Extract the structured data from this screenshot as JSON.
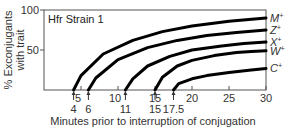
{
  "chart_data": {
    "type": "line",
    "title": "Hfr Strain 1",
    "xlabel": "Minutes prior to interruption of conjugation",
    "ylabel": "% Exconjugants with trait",
    "xlim": [
      0,
      30
    ],
    "ylim": [
      0,
      100
    ],
    "x_ticks": [
      5,
      10,
      15,
      20,
      25,
      30
    ],
    "y_ticks": [
      50,
      100
    ],
    "grid": false,
    "legend_position": "right-end labels",
    "entry_times": [
      {
        "label": "4",
        "value": 4
      },
      {
        "label": "6",
        "value": 6
      },
      {
        "label": "11",
        "value": 11
      },
      {
        "label": "15",
        "value": 15
      },
      {
        "label": "17.5",
        "value": 17.5
      }
    ],
    "series": [
      {
        "name": "M+",
        "entry_time": 4,
        "x": [
          4,
          5,
          8,
          12,
          16,
          20,
          25,
          30
        ],
        "values": [
          0,
          18,
          45,
          62,
          73,
          80,
          86,
          90
        ]
      },
      {
        "name": "Z+",
        "entry_time": 6,
        "x": [
          6,
          7,
          10,
          14,
          18,
          22,
          26,
          30
        ],
        "values": [
          0,
          15,
          38,
          53,
          62,
          68,
          72,
          75
        ]
      },
      {
        "name": "X+",
        "entry_time": 11,
        "x": [
          11,
          12,
          14,
          17,
          20,
          24,
          27,
          30
        ],
        "values": [
          0,
          14,
          30,
          42,
          50,
          55,
          58,
          60
        ]
      },
      {
        "name": "W+",
        "entry_time": 15,
        "x": [
          15,
          16,
          18,
          20,
          23,
          26,
          28,
          30
        ],
        "values": [
          0,
          16,
          30,
          37,
          43,
          47,
          48,
          49
        ]
      },
      {
        "name": "C+",
        "entry_time": 17.5,
        "x": [
          17.5,
          18.2,
          20,
          22,
          25,
          28,
          30
        ],
        "values": [
          0,
          8,
          14,
          18,
          22,
          25,
          27
        ]
      }
    ]
  }
}
